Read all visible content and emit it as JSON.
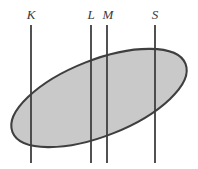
{
  "figure": {
    "type": "geometric-diagram",
    "canvas": {
      "width": 198,
      "height": 169,
      "background": "#ffffff"
    },
    "ellipse": {
      "name": "shaded-ellipse",
      "center_x": 99,
      "center_y": 98,
      "semi_major": 93,
      "semi_minor": 38,
      "rotation_deg": -21.5,
      "fill_color": "#c9c9c9",
      "stroke_color": "#3f3f3f",
      "stroke_width": 2.1
    },
    "lines": [
      {
        "id": "line-k",
        "label": "K",
        "x": 31,
        "y_top": 25,
        "y_bottom": 163,
        "label_x": 31,
        "label_y": 8,
        "stroke_color": "#3f3f3f",
        "stroke_width": 1.8
      },
      {
        "id": "line-l",
        "label": "L",
        "x": 91,
        "y_top": 25,
        "y_bottom": 163,
        "label_x": 91,
        "label_y": 8,
        "stroke_color": "#3f3f3f",
        "stroke_width": 1.8
      },
      {
        "id": "line-m",
        "label": "M",
        "x": 107,
        "y_top": 25,
        "y_bottom": 163,
        "label_x": 108,
        "label_y": 8,
        "stroke_color": "#3f3f3f",
        "stroke_width": 1.8
      },
      {
        "id": "line-s",
        "label": "S",
        "x": 155,
        "y_top": 25,
        "y_bottom": 163,
        "label_x": 155,
        "label_y": 8,
        "stroke_color": "#3f3f3f",
        "stroke_width": 1.8
      }
    ]
  }
}
